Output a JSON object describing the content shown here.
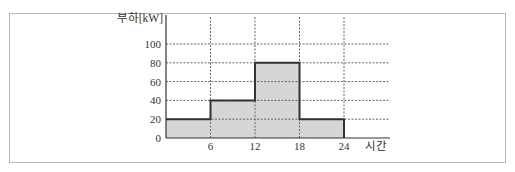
{
  "chart_data": {
    "type": "step-area",
    "title": "",
    "ylabel": "부하[kW]",
    "xlabel": "시간",
    "x_ticks": [
      "6",
      "12",
      "18",
      "24"
    ],
    "y_ticks": [
      "0",
      "20",
      "40",
      "60",
      "80",
      "100"
    ],
    "xlim": [
      0,
      24
    ],
    "ylim": [
      0,
      100
    ],
    "grid": true,
    "grid_style": "dotted",
    "segments": [
      {
        "x_start": 0,
        "x_end": 6,
        "load": 20
      },
      {
        "x_start": 6,
        "x_end": 12,
        "load": 40
      },
      {
        "x_start": 12,
        "x_end": 18,
        "load": 80
      },
      {
        "x_start": 18,
        "x_end": 24,
        "load": 20
      }
    ],
    "fill_color": "#d6d6d6",
    "line_color": "#333333"
  }
}
